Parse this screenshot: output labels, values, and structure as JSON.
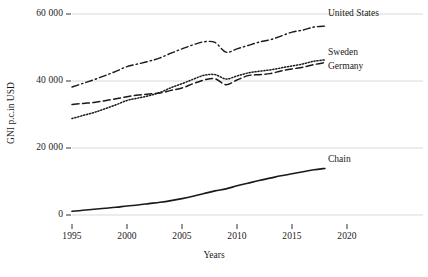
{
  "chart_data": {
    "type": "line",
    "title": "",
    "xlabel": "Years",
    "ylabel": "GNI p.c.in USD",
    "xlim": [
      1995,
      2021
    ],
    "ylim": [
      0,
      65000
    ],
    "grid": true,
    "legend_position": "inline-right-of-series",
    "yticks": [
      0,
      20000,
      40000,
      60000
    ],
    "ytick_labels": [
      "0",
      "20 000",
      "40 000",
      "60 000"
    ],
    "xticks": [
      1995,
      2000,
      2005,
      2010,
      2015,
      2020
    ],
    "xtick_labels": [
      "1995",
      "2000",
      "2005",
      "2010",
      "2015",
      "2020"
    ],
    "x": [
      1995,
      1996,
      1997,
      1998,
      1999,
      2000,
      2001,
      2002,
      2003,
      2004,
      2005,
      2006,
      2007,
      2008,
      2009,
      2010,
      2011,
      2012,
      2013,
      2014,
      2015,
      2016,
      2017,
      2018
    ],
    "series": [
      {
        "name": "United States",
        "label": "United States",
        "style": "dash-dot",
        "color": "#1a1a1a",
        "values": [
          38200,
          39300,
          40400,
          41600,
          42900,
          44300,
          45100,
          45900,
          46900,
          48300,
          49600,
          50800,
          51700,
          51500,
          48600,
          49600,
          50600,
          51600,
          52300,
          53400,
          54600,
          55200,
          56100,
          56400
        ]
      },
      {
        "name": "Sweden",
        "label": "Sweden",
        "style": "dotted",
        "color": "#1a1a1a",
        "values": [
          28800,
          29700,
          30600,
          31700,
          32900,
          34200,
          34900,
          35600,
          36600,
          38000,
          39200,
          40500,
          41700,
          41900,
          40600,
          41500,
          42400,
          42900,
          43300,
          43900,
          44500,
          45100,
          45900,
          46300
        ]
      },
      {
        "name": "Germany",
        "label": "Germany",
        "style": "dashed",
        "color": "#1a1a1a",
        "values": [
          33000,
          33300,
          33600,
          34100,
          34700,
          35300,
          35800,
          36100,
          36400,
          37200,
          37900,
          39200,
          40300,
          40700,
          38900,
          40300,
          41600,
          41900,
          42200,
          43000,
          43600,
          44100,
          44900,
          45500
        ]
      },
      {
        "name": "Chain",
        "label": "Chain",
        "style": "solid",
        "color": "#1a1a1a",
        "values": [
          1100,
          1400,
          1700,
          2000,
          2300,
          2700,
          3000,
          3400,
          3800,
          4300,
          4900,
          5600,
          6400,
          7200,
          7800,
          8700,
          9500,
          10300,
          11000,
          11700,
          12300,
          12900,
          13500,
          13900
        ]
      }
    ]
  }
}
